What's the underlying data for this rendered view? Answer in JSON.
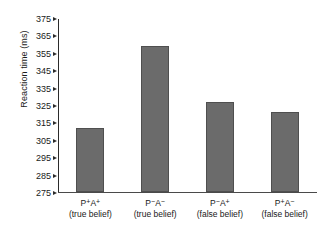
{
  "chart_data": {
    "type": "bar",
    "title": "",
    "xlabel": "",
    "ylabel": "Reaction time (ms)",
    "ylim": [
      275,
      375
    ],
    "ytick_step": 10,
    "grid": false,
    "legend": null,
    "bar_color": "#6b6b6b",
    "bar_edge_color": "#4f4f4f",
    "axis_color": "#2b2b2b",
    "yticks": [
      275,
      285,
      295,
      305,
      315,
      325,
      335,
      345,
      355,
      365,
      375
    ],
    "ytick_labels": [
      "275",
      "285",
      "295",
      "305",
      "315",
      "325",
      "335",
      "345",
      "355",
      "365",
      "375"
    ],
    "categories": [
      {
        "code_p": "P",
        "code_p_sign": "+",
        "code_a": "A",
        "code_a_sign": "+",
        "line1": "P+A+",
        "line2": "(true belief)"
      },
      {
        "code_p": "P",
        "code_p_sign": "−",
        "code_a": "A",
        "code_a_sign": "−",
        "line1": "P−A−",
        "line2": "(true belief)"
      },
      {
        "code_p": "P",
        "code_p_sign": "−",
        "code_a": "A",
        "code_a_sign": "+",
        "line1": "P−A+",
        "line2": "(false belief)"
      },
      {
        "code_p": "P",
        "code_p_sign": "+",
        "code_a": "A",
        "code_a_sign": "−",
        "line1": "P+A−",
        "line2": "(false belief)"
      }
    ],
    "values": [
      312,
      359,
      327,
      321
    ]
  }
}
